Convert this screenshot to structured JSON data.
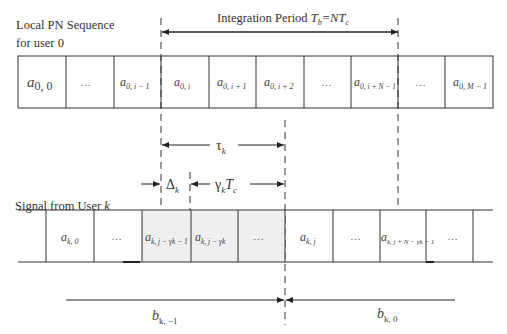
{
  "labels": {
    "local_seq_line1": "Local PN Sequence",
    "local_seq_line2": "for user 0",
    "integration_prefix": "Integration Period ",
    "integration_Tb": "T",
    "integration_Tb_sub": "b",
    "integration_eq": "=NT",
    "integration_Tc_sub": "c",
    "signal_from_user": "Signal from User ",
    "signal_user_k": "k",
    "tau": "τ",
    "tau_sub": "k",
    "delta": "Δ",
    "delta_sub": "k",
    "gamma": "γ",
    "gamma_sub": "k",
    "gamma_T": "T",
    "gamma_T_sub": "c",
    "b_prev": "b",
    "b_prev_sub": "k, −1",
    "b_curr": "b",
    "b_curr_sub": "k, 0"
  },
  "top_row": {
    "cells": [
      {
        "main": "a",
        "sub": "0, 0"
      },
      {
        "main": "…",
        "sub": ""
      },
      {
        "main": "a",
        "sub": "0, i − 1"
      },
      {
        "main": "a",
        "sub": "0, i"
      },
      {
        "main": "a",
        "sub": "0, i + 1"
      },
      {
        "main": "a",
        "sub": "0, i + 2"
      },
      {
        "main": "…",
        "sub": ""
      },
      {
        "main": "a",
        "sub": "0, i + N − 1"
      },
      {
        "main": "…",
        "sub": ""
      },
      {
        "main": "a",
        "sub": "0, M − 1"
      }
    ]
  },
  "bottom_row": {
    "cells": [
      {
        "main": "a",
        "sub": "k, 0"
      },
      {
        "main": "…",
        "sub": ""
      },
      {
        "main": "a",
        "sub": "k, j − γk − 1"
      },
      {
        "main": "a",
        "sub": "k, j − γk"
      },
      {
        "main": "…",
        "sub": ""
      },
      {
        "main": "a",
        "sub": "k, j"
      },
      {
        "main": "…",
        "sub": ""
      },
      {
        "main": "a",
        "sub": "k, j + N − γk − 1"
      },
      {
        "main": "…",
        "sub": ""
      }
    ]
  },
  "colors": {
    "line": "#333333",
    "shade": "#efefef",
    "background": "#ffffff"
  }
}
